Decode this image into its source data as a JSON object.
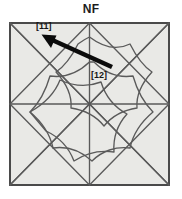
{
  "figure": {
    "title": "NF",
    "type": "crystallographic-pattern-diagram",
    "frame": {
      "x": 9,
      "y": 22,
      "width": 161,
      "height": 164,
      "fill_color": "#e9e9e6",
      "border_color": "#4a4a4a",
      "border_width": 2
    },
    "style": {
      "line_color": "#5a5a5a",
      "line_width": 1.3,
      "arrow_color": "#0b0b0b",
      "background_color": "#ffffff",
      "label_color": "#161616"
    },
    "annotations": [
      {
        "id": "dir-11",
        "label": "[11]",
        "label_x": 36,
        "label_y": 21,
        "arrow": {
          "tail_x": 112,
          "tail_y": 67,
          "head_x": 43,
          "head_y": 35,
          "shaft_width": 4.5,
          "head_length": 13,
          "head_width": 12
        }
      },
      {
        "id": "dir-12",
        "label": "[12]",
        "label_x": 91,
        "label_y": 70,
        "arrow": null
      }
    ],
    "geometry": {
      "center_x": 89.5,
      "center_y": 104,
      "half": 80.5,
      "quadrant_diagonals": true,
      "midlines": true,
      "rosette_rings": 2
    }
  }
}
